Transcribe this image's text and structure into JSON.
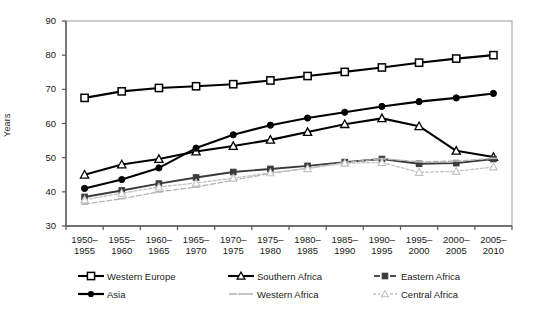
{
  "chart_data": {
    "type": "line",
    "title": "",
    "xlabel": "",
    "ylabel": "Years",
    "ylim": [
      30,
      90
    ],
    "ytick_step": 10,
    "yticks": [
      90,
      80,
      70,
      60,
      50,
      40,
      30
    ],
    "grid": false,
    "legend_position": "bottom",
    "categories": [
      "1950–\n1955",
      "1955–\n1960",
      "1960–\n1965",
      "1965–\n1970",
      "1970–\n1975",
      "1975–\n1980",
      "1980–\n1985",
      "1985–\n1990",
      "1990–\n1995",
      "1995–\n2000",
      "2000–\n2005",
      "2005–\n2010"
    ],
    "category_labels_top": [
      "1950–",
      "1955–",
      "1960–",
      "1965–",
      "1970–",
      "1975–",
      "1980–",
      "1985–",
      "1990–",
      "1995–",
      "2000–",
      "2005–"
    ],
    "category_labels_bottom": [
      "1955",
      "1960",
      "1965",
      "1970",
      "1975",
      "1980",
      "1985",
      "1990",
      "1995",
      "2000",
      "2005",
      "2010"
    ],
    "series": [
      {
        "name": "Western Europe",
        "marker": "open-square",
        "color": "#000000",
        "values": [
          67.5,
          69.4,
          70.4,
          70.9,
          71.5,
          72.6,
          73.9,
          75.1,
          76.4,
          77.8,
          79.0,
          80.0
        ]
      },
      {
        "name": "Southern Africa",
        "marker": "open-triangle",
        "color": "#000000",
        "values": [
          45.0,
          48.0,
          49.6,
          51.8,
          53.4,
          55.2,
          57.5,
          59.8,
          61.5,
          59.2,
          52.0,
          50.2
        ]
      },
      {
        "name": "Eastern Africa",
        "marker": "filled-square",
        "color": "#3a3a3a",
        "values": [
          38.5,
          40.4,
          42.4,
          44.2,
          45.8,
          46.7,
          47.6,
          48.7,
          49.6,
          48.2,
          48.4,
          49.6
        ]
      },
      {
        "name": "Asia",
        "marker": "filled-circle",
        "color": "#000000",
        "values": [
          41.0,
          43.6,
          47.0,
          52.8,
          56.7,
          59.5,
          61.6,
          63.3,
          65.0,
          66.4,
          67.5,
          68.8
        ]
      },
      {
        "name": "Western Africa",
        "marker": "dash-light",
        "color": "#b5b5b5",
        "values": [
          36.4,
          38.0,
          40.0,
          41.4,
          43.4,
          45.4,
          46.9,
          48.6,
          49.7,
          48.8,
          49.0,
          49.8
        ]
      },
      {
        "name": "Central Africa",
        "marker": "open-triangle-light",
        "color": "#c2c2c2",
        "values": [
          37.7,
          39.6,
          41.4,
          42.6,
          44.0,
          45.6,
          46.8,
          48.4,
          48.6,
          45.7,
          46.0,
          47.3
        ]
      }
    ]
  },
  "legend": {
    "row1": [
      "Western Europe",
      "Southern Africa",
      "Eastern Africa"
    ],
    "row2": [
      "Asia",
      "Western Africa",
      "Central Africa"
    ]
  }
}
